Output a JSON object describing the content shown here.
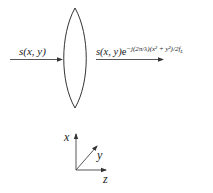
{
  "diagram": {
    "type": "thin-lens phase transformation",
    "input_label": {
      "func": "s",
      "args": "(x, y)"
    },
    "output_label": {
      "func": "s",
      "args": "(x, y)",
      "base": "e",
      "exponent": "−j(2π/λ)(x² + y²)/2f",
      "exponent_subscript": "L"
    },
    "axes": {
      "x": "x",
      "y": "y",
      "z": "z"
    },
    "colors": {
      "stroke": "#333333",
      "text": "#222222"
    }
  }
}
